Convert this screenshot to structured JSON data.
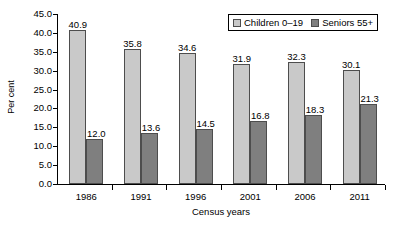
{
  "chart_data": {
    "type": "bar",
    "title": "",
    "xlabel": "Census years",
    "ylabel": "Per cent",
    "categories": [
      "1986",
      "1991",
      "1996",
      "2001",
      "2006",
      "2011"
    ],
    "series": [
      {
        "name": "Children 0–19",
        "color": "#c9c9c9",
        "values": [
          40.9,
          35.8,
          34.6,
          31.9,
          32.3,
          30.1
        ]
      },
      {
        "name": "Seniors 55+",
        "color": "#7f7f7f",
        "values": [
          12.0,
          13.6,
          14.5,
          16.8,
          18.3,
          21.3
        ]
      }
    ],
    "ylim": [
      0.0,
      45.0
    ],
    "y_ticks": [
      "45.0",
      "40.0",
      "35.0",
      "30.0",
      "25.0",
      "20.0",
      "15.0",
      "10.0",
      "5.0",
      "0.0"
    ],
    "y_tick_values": [
      45.0,
      40.0,
      35.0,
      30.0,
      25.0,
      20.0,
      15.0,
      10.0,
      5.0,
      0.0
    ],
    "grid": false,
    "legend_position": "top-right",
    "data_labels": [
      [
        "40.9",
        "12.0"
      ],
      [
        "35.8",
        "13.6"
      ],
      [
        "34.6",
        "14.5"
      ],
      [
        "31.9",
        "16.8"
      ],
      [
        "32.3",
        "18.3"
      ],
      [
        "30.1",
        "21.3"
      ]
    ]
  }
}
